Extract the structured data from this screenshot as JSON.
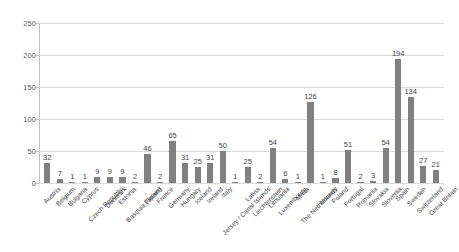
{
  "chart_data": {
    "type": "bar",
    "title": "",
    "subtitle": "",
    "xlabel": "",
    "ylabel": "",
    "ylim": [
      0,
      250
    ],
    "yticks": [
      0,
      50,
      100,
      150,
      200,
      250
    ],
    "grid": true,
    "legend": "none",
    "series_color": "#808080",
    "show_data_labels": true,
    "categories": [
      "Austria",
      "Belgium",
      "Bulgaria",
      "Cyprus",
      "Czech Republic",
      "Denmark",
      "Estonia",
      "Basquia (Spain)",
      "Finland",
      "France",
      "Germany",
      "Hungary",
      "Iceland",
      "Ireland",
      "Italy",
      "Jersey / Canal Islands",
      "Latvia",
      "Liechtenstein",
      "Lithuania",
      "Luxembourg",
      "Malta",
      "The Netherlands",
      "Norway",
      "Poland",
      "Portugal",
      "Romania",
      "Slovakia",
      "Slovenia",
      "Spain",
      "Sweden",
      "Switzerland",
      "Great Britain"
    ],
    "values": [
      32,
      7,
      1,
      1,
      9,
      9,
      9,
      2,
      46,
      2,
      65,
      31,
      25,
      31,
      50,
      1,
      25,
      2,
      54,
      6,
      1,
      126,
      1,
      8,
      51,
      2,
      3,
      54,
      194,
      134,
      27,
      21
    ]
  }
}
